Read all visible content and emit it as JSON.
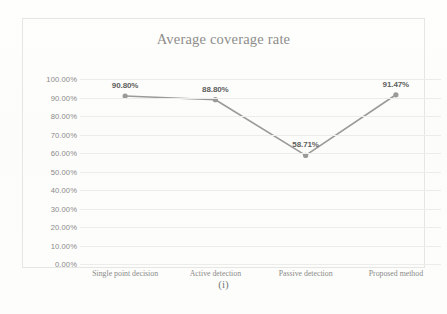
{
  "figure": {
    "caption": "(i)"
  },
  "chart_data": {
    "type": "line",
    "title": "Average coverage rate",
    "xlabel": "",
    "ylabel": "",
    "categories": [
      "Single point decision",
      "Active detection",
      "Passive detection",
      "Proposed method"
    ],
    "values": [
      90.8,
      88.8,
      58.71,
      91.47
    ],
    "point_labels": [
      "90.80%",
      "88.80%",
      "58.71%",
      "91.47%"
    ],
    "ylim": [
      0,
      100
    ],
    "ytick_labels": [
      "100.00%",
      "90.00%",
      "80.00%",
      "70.00%",
      "60.00%",
      "50.00%",
      "40.00%",
      "30.00%",
      "20.00%",
      "10.00%",
      "0.00%"
    ],
    "ytick_values": [
      100,
      90,
      80,
      70,
      60,
      50,
      40,
      30,
      20,
      10,
      0
    ],
    "grid": true,
    "legend": false,
    "legend_position": "none",
    "series": [
      {
        "name": "Average coverage rate",
        "values": [
          90.8,
          88.8,
          58.71,
          91.47
        ],
        "color": "#9a9a98",
        "marker": "circle"
      }
    ],
    "colors": {
      "line": "#9a9a98",
      "marker": "#9a9a98",
      "gridline": "#ececea",
      "axis_text": "#8a8a88",
      "title_text": "#8d8d8b",
      "data_label_text": "#5e5e5c",
      "frame": "#e6e6e4"
    }
  }
}
